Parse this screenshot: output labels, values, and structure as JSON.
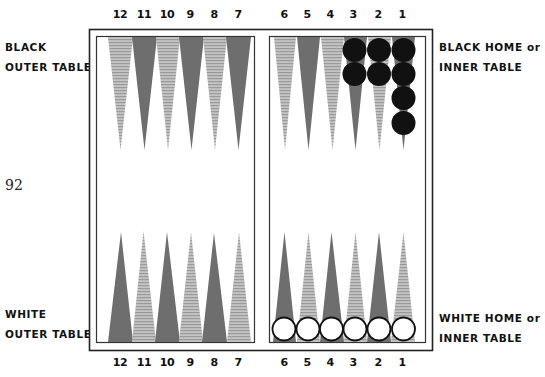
{
  "figure": {
    "page_number": "92",
    "labels": {
      "black_outer": [
        "BLACK",
        "OUTER TABLE"
      ],
      "black_home": [
        "BLACK HOME or",
        "INNER TABLE"
      ],
      "white_outer": [
        "WHITE",
        "OUTER TABLE"
      ],
      "white_home": [
        "WHITE HOME or",
        "INNER TABLE"
      ]
    },
    "top_point_numbers": [
      "12",
      "11",
      "10",
      "9",
      "8",
      "7",
      "6",
      "5",
      "4",
      "3",
      "2",
      "1"
    ],
    "bottom_point_numbers": [
      "12",
      "11",
      "10",
      "9",
      "8",
      "7",
      "6",
      "5",
      "4",
      "3",
      "2",
      "1"
    ],
    "colors": {
      "dark_point": "#6e6e6e",
      "light_point": "#b4b4b4",
      "black_checker": "#111111",
      "white_checker": "#ffffff",
      "frame": "#222222"
    },
    "checkers": {
      "black": [
        {
          "point": "3",
          "side": "top",
          "count": 2
        },
        {
          "point": "2",
          "side": "top",
          "count": 2
        },
        {
          "point": "1",
          "side": "top",
          "count": 4
        }
      ],
      "white": [
        {
          "point": "6",
          "side": "bottom",
          "count": 1
        },
        {
          "point": "5",
          "side": "bottom",
          "count": 1
        },
        {
          "point": "4",
          "side": "bottom",
          "count": 1
        },
        {
          "point": "3",
          "side": "bottom",
          "count": 1
        },
        {
          "point": "2",
          "side": "bottom",
          "count": 1
        },
        {
          "point": "1",
          "side": "bottom",
          "count": 1
        }
      ]
    }
  }
}
